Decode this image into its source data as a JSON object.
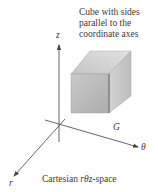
{
  "figure": {
    "annotation_lines": [
      "Cube with sides",
      "parallel to the",
      "coordinate axes"
    ],
    "region_label": "G",
    "axes": {
      "z": "z",
      "theta": "θ",
      "r": "r"
    },
    "caption": {
      "prefix": "Cartesian ",
      "italic": "rθz",
      "suffix": "-space"
    }
  },
  "colors": {
    "axis": "#555555",
    "cube_front": "#b9b9b9",
    "cube_top": "#d6d6d6",
    "cube_side": "#c6c6c6",
    "text": "#3a3a3a"
  }
}
